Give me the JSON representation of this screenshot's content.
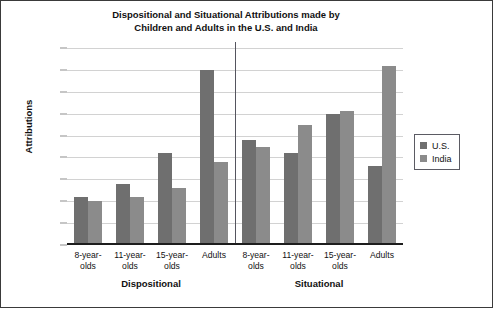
{
  "chart_data": {
    "type": "bar",
    "title": "Dispositional and Situational Attributions made by Children and Adults in the U.S. and India",
    "title_lines": [
      "Dispositional and Situational Attributions made by",
      "Children and Adults in the U.S. and India"
    ],
    "xlabel": "",
    "ylabel": "Attributions",
    "ylim": [
      0,
      0.45
    ],
    "ytick_labels": [
      "0",
      "0.05",
      "0.1",
      "0.15",
      "0.2",
      "0.25",
      "0.3",
      "0.35",
      "0.4",
      "0.45"
    ],
    "ytick_values": [
      0,
      0.05,
      0.1,
      0.15,
      0.2,
      0.25,
      0.3,
      0.35,
      0.4,
      0.45
    ],
    "grid": "horizontal",
    "legend_position": "right",
    "groups": [
      {
        "name": "Dispositional",
        "categories": [
          "8-year-olds",
          "11-year-olds",
          "15-year-olds",
          "Adults"
        ],
        "category_lines": [
          [
            "8-year-",
            "olds"
          ],
          [
            "11-year-",
            "olds"
          ],
          [
            "15-year-",
            "olds"
          ],
          [
            "Adults",
            ""
          ]
        ]
      },
      {
        "name": "Situational",
        "categories": [
          "8-year-olds",
          "11-year-olds",
          "15-year-olds",
          "Adults"
        ],
        "category_lines": [
          [
            "8-year-",
            "olds"
          ],
          [
            "11-year-",
            "olds"
          ],
          [
            "15-year-",
            "olds"
          ],
          [
            "Adults",
            ""
          ]
        ]
      }
    ],
    "categories": [
      "Dispositional 8-year-olds",
      "Dispositional 11-year-olds",
      "Dispositional 15-year-olds",
      "Dispositional Adults",
      "Situational 8-year-olds",
      "Situational 11-year-olds",
      "Situational 15-year-olds",
      "Situational Adults"
    ],
    "series": [
      {
        "name": "U.S.",
        "color": "#6f6f6f",
        "values": [
          0.11,
          0.14,
          0.21,
          0.4,
          0.24,
          0.21,
          0.3,
          0.18
        ]
      },
      {
        "name": "India",
        "color": "#8b8b8b",
        "values": [
          0.1,
          0.11,
          0.13,
          0.19,
          0.225,
          0.275,
          0.305,
          0.41
        ]
      }
    ]
  },
  "legend": {
    "items": [
      {
        "label": "U.S.",
        "color": "#6f6f6f"
      },
      {
        "label": "India",
        "color": "#8b8b8b"
      }
    ]
  }
}
